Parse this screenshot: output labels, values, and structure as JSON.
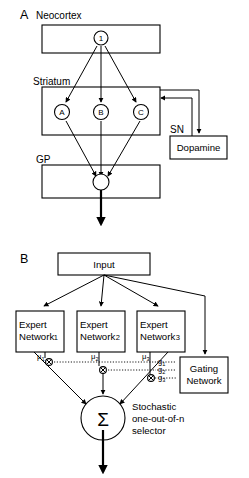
{
  "figure": {
    "panels": [
      {
        "letter": "A",
        "name": "basal-ganglia-anatomy",
        "region_labels": [
          {
            "text": "Neocortex"
          },
          {
            "text": "Striatum"
          },
          {
            "text": "GP"
          },
          {
            "text": "SN"
          }
        ],
        "boxes": [
          {
            "name": "neocortex-box",
            "label": ""
          },
          {
            "name": "striatum-box",
            "label": ""
          },
          {
            "name": "gp-box",
            "label": ""
          },
          {
            "name": "dopamine-box",
            "label": "Dopamine"
          }
        ],
        "nodes": [
          {
            "name": "cortex-node-1",
            "label": "1"
          },
          {
            "name": "striatum-node-a",
            "label": "A"
          },
          {
            "name": "striatum-node-b",
            "label": "B"
          },
          {
            "name": "striatum-node-c",
            "label": "C"
          },
          {
            "name": "gp-node",
            "label": ""
          }
        ]
      },
      {
        "letter": "B",
        "name": "mixture-of-experts-model",
        "input_box": {
          "label": "Input"
        },
        "experts": [
          {
            "line1": "Expert",
            "line2": "Network",
            "index": "1",
            "mu": "μ",
            "mu_sub": "1",
            "g": "g",
            "g_sub": "1"
          },
          {
            "line1": "Expert",
            "line2": "Network",
            "index": "2",
            "mu": "μ",
            "mu_sub": "2",
            "g": "g",
            "g_sub": "2"
          },
          {
            "line1": "Expert",
            "line2": "Network",
            "index": "3",
            "mu": "μ",
            "mu_sub": "3",
            "g": "g",
            "g_sub": "3"
          }
        ],
        "gating_box": {
          "line1": "Gating",
          "line2": "Network"
        },
        "summation": {
          "symbol": "Σ"
        },
        "selector_caption": {
          "line1": "Stochastic",
          "line2": "one-out-of-n",
          "line3": "selector"
        }
      }
    ],
    "colors": {
      "stroke": "#000000",
      "background": "#ffffff"
    }
  }
}
